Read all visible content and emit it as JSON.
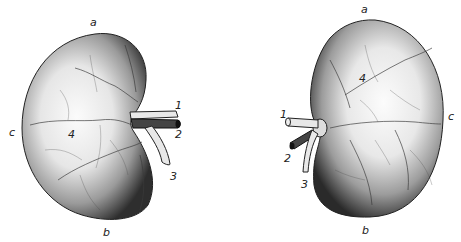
{
  "figure": {
    "colors": {
      "background": "#ffffff",
      "ink": "#222222",
      "shade_dark": "#2a2a2a",
      "shade_light": "#f4f4f4"
    },
    "left_kidney": {
      "labels": {
        "a": "a",
        "b": "b",
        "c": "c",
        "n1": "1",
        "n2": "2",
        "n3": "3",
        "n4": "4"
      }
    },
    "right_kidney": {
      "labels": {
        "a": "a",
        "b": "b",
        "c": "c",
        "n1": "1",
        "n2": "2",
        "n3": "3",
        "n4": "4"
      }
    }
  }
}
